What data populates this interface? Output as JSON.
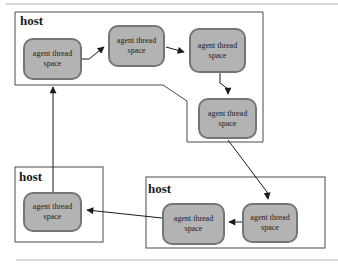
{
  "diagram": {
    "hosts": [
      {
        "id": "host-top",
        "label": "host"
      },
      {
        "id": "host-bottom-left",
        "label": "host"
      },
      {
        "id": "host-bottom-right",
        "label": "host"
      }
    ],
    "nodes": [
      {
        "id": "agent-1",
        "line1": "agent thread",
        "line2": "space"
      },
      {
        "id": "agent-2",
        "line1": "agent thread",
        "line2": "space"
      },
      {
        "id": "agent-3",
        "line1": "agent thread",
        "line2": "space"
      },
      {
        "id": "agent-4",
        "line1": "agent thread",
        "line2": "space"
      },
      {
        "id": "agent-5",
        "line1": "agent thread",
        "line2": "space"
      },
      {
        "id": "agent-6",
        "line1": "agent thread",
        "line2": "space"
      },
      {
        "id": "agent-7",
        "line1": "agent thread",
        "line2": "space"
      }
    ],
    "arrows": [
      {
        "from": "agent-1",
        "to": "agent-2"
      },
      {
        "from": "agent-2",
        "to": "agent-3"
      },
      {
        "from": "agent-3",
        "to": "agent-4"
      },
      {
        "from": "agent-4",
        "to": "agent-6"
      },
      {
        "from": "agent-6",
        "to": "agent-5"
      },
      {
        "from": "agent-5",
        "to": "agent-7"
      },
      {
        "from": "agent-7",
        "to": "agent-1"
      }
    ],
    "colors": {
      "node_fill": "#b3b3b3",
      "node_border": "#757575",
      "host_border": "#4a4a4a",
      "arrow": "#1a1a1a",
      "frame_rule": "#adadad",
      "background": "#ffffff"
    }
  }
}
